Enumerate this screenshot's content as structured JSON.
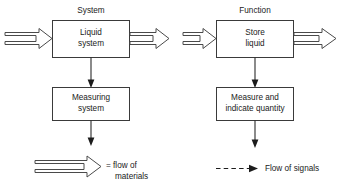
{
  "diagram": {
    "title_left": "System",
    "title_right": "Function",
    "columns": [
      {
        "id": "system-column",
        "header": "System",
        "blocks": [
          {
            "id": "liquid-system",
            "lines": [
              "Liquid",
              "system"
            ]
          },
          {
            "id": "measuring-system",
            "lines": [
              "Measuring",
              "system"
            ]
          }
        ],
        "input_arrow": "hollow-arrow-right",
        "output_arrow": "hollow-arrow-right"
      },
      {
        "id": "function-column",
        "header": "Function",
        "blocks": [
          {
            "id": "store-liquid",
            "lines": [
              "Store",
              "liquid"
            ]
          },
          {
            "id": "measure-indicate-quantity",
            "lines": [
              "Measure and",
              "indicate quantity"
            ]
          }
        ],
        "input_arrow": "hollow-arrow-right",
        "output_arrow": "hollow-arrow-right"
      }
    ],
    "legend": [
      {
        "id": "legend-material-flow",
        "symbol": "hollow-arrow-right",
        "lines": [
          "= flow of",
          "materials"
        ]
      },
      {
        "id": "legend-signal-flow",
        "symbol": "dashed-arrow-right",
        "lines": [
          "Flow of signals"
        ]
      }
    ],
    "colors": {
      "background": "#ffffff",
      "box_stroke": "#3a3a3a",
      "line": "#2b2b2b",
      "arrow_outline": "#4a4a4a",
      "arrow_fill_solid": "#1c1c1c",
      "text": "#1a1a1a"
    }
  }
}
